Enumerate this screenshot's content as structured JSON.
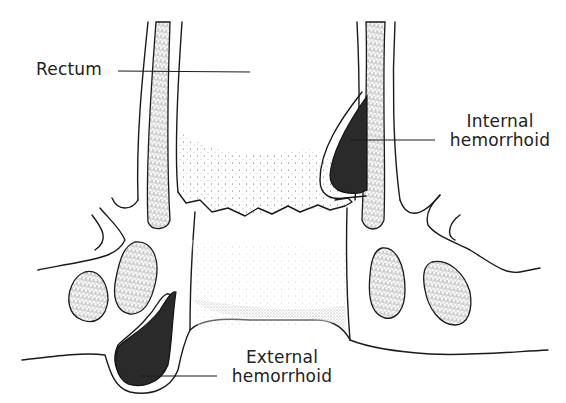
{
  "diagram": {
    "labels": {
      "rectum": "Rectum",
      "internal_line1": "Internal",
      "internal_line2": "hemorrhoid",
      "external_line1": "External",
      "external_line2": "hemorrhoid"
    },
    "colors": {
      "ink": "#1a1a1a",
      "hemorrhoid_fill": "#2a2a2a",
      "background": "#ffffff"
    }
  }
}
